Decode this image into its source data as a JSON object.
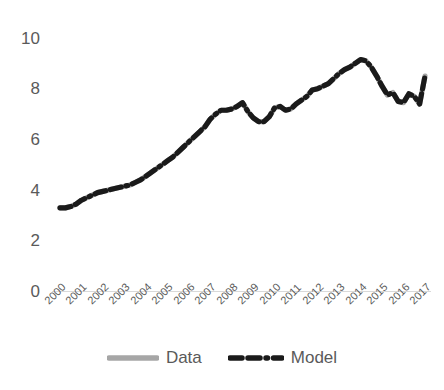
{
  "chart_data": {
    "type": "line",
    "title": "",
    "xlabel": "",
    "ylabel": "",
    "ylim": [
      0,
      10
    ],
    "yticks": [
      "0",
      "2",
      "4",
      "6",
      "8",
      "10"
    ],
    "ytick_values": [
      0,
      2,
      4,
      6,
      8,
      10
    ],
    "grid": false,
    "legend_position": "bottom-center",
    "x": [
      2000,
      2001,
      2002,
      2003,
      2004,
      2005,
      2006,
      2007,
      2008,
      2009,
      2010,
      2011,
      2012,
      2013,
      2014,
      2015,
      2016,
      2017
    ],
    "categories": [
      "2000",
      "2001",
      "2002",
      "2003",
      "2004",
      "2005",
      "2006",
      "2007",
      "2008",
      "2009",
      "2010",
      "2011",
      "2012",
      "2013",
      "2014",
      "2015",
      "2016",
      "2017"
    ],
    "series": [
      {
        "name": "Data",
        "color": "#a6a6a6",
        "style": "solid",
        "width": 5,
        "values": [
          3.3,
          3.6,
          3.9,
          4.1,
          4.5,
          5.1,
          5.7,
          6.4,
          7.2,
          6.8,
          7.2,
          7.4,
          8.0,
          8.6,
          9.1,
          7.7,
          7.6,
          8.4
        ]
      },
      {
        "name": "Model",
        "color": "#1a1a1a",
        "style": "dash-dash-dot",
        "width": 5,
        "values": [
          3.3,
          3.6,
          3.9,
          4.1,
          4.5,
          5.1,
          5.7,
          6.4,
          7.2,
          6.8,
          7.2,
          7.4,
          8.0,
          8.6,
          9.1,
          7.7,
          7.6,
          8.4
        ]
      }
    ],
    "dense_points": {
      "note": "quarterly-resolution trace read off the plotted curve",
      "x": [
        2000.0,
        2000.25,
        2000.5,
        2000.75,
        2001.0,
        2001.25,
        2001.5,
        2001.75,
        2002.0,
        2002.25,
        2002.5,
        2002.75,
        2003.0,
        2003.25,
        2003.5,
        2003.75,
        2004.0,
        2004.25,
        2004.5,
        2004.75,
        2005.0,
        2005.25,
        2005.5,
        2005.75,
        2006.0,
        2006.25,
        2006.5,
        2006.75,
        2007.0,
        2007.25,
        2007.5,
        2007.75,
        2008.0,
        2008.25,
        2008.5,
        2008.75,
        2009.0,
        2009.25,
        2009.5,
        2009.75,
        2010.0,
        2010.25,
        2010.5,
        2010.75,
        2011.0,
        2011.25,
        2011.5,
        2011.75,
        2012.0,
        2012.25,
        2012.5,
        2012.75,
        2013.0,
        2013.25,
        2013.5,
        2013.75,
        2014.0,
        2014.25,
        2014.5,
        2014.75,
        2015.0,
        2015.25,
        2015.5,
        2015.75,
        2016.0,
        2016.25,
        2016.5,
        2016.75,
        2017.0
      ],
      "y": [
        3.3,
        3.3,
        3.35,
        3.45,
        3.6,
        3.7,
        3.8,
        3.9,
        3.95,
        4.0,
        4.05,
        4.1,
        4.15,
        4.2,
        4.3,
        4.4,
        4.55,
        4.7,
        4.85,
        5.0,
        5.15,
        5.3,
        5.5,
        5.7,
        5.9,
        6.1,
        6.3,
        6.5,
        6.8,
        7.0,
        7.15,
        7.15,
        7.2,
        7.3,
        7.45,
        7.1,
        6.85,
        6.7,
        6.7,
        6.9,
        7.25,
        7.3,
        7.15,
        7.2,
        7.4,
        7.55,
        7.7,
        7.95,
        8.0,
        8.1,
        8.2,
        8.4,
        8.6,
        8.75,
        8.85,
        9.0,
        9.15,
        9.1,
        8.85,
        8.5,
        8.1,
        7.75,
        7.85,
        7.5,
        7.45,
        7.8,
        7.7,
        7.4,
        8.5
      ]
    }
  },
  "legend": {
    "items": [
      {
        "label": "Data",
        "color": "#a6a6a6",
        "style": "solid"
      },
      {
        "label": "Model",
        "color": "#1a1a1a",
        "style": "dash-dash-dot"
      }
    ]
  },
  "axes": {
    "y_labels": [
      "10",
      "8",
      "6",
      "4",
      "2",
      "0"
    ],
    "x_labels": [
      "2000",
      "2001",
      "2002",
      "2003",
      "2004",
      "2005",
      "2006",
      "2007",
      "2008",
      "2009",
      "2010",
      "2011",
      "2012",
      "2013",
      "2014",
      "2015",
      "2016",
      "2017"
    ],
    "axis_line_color": "#d9d9d9"
  }
}
